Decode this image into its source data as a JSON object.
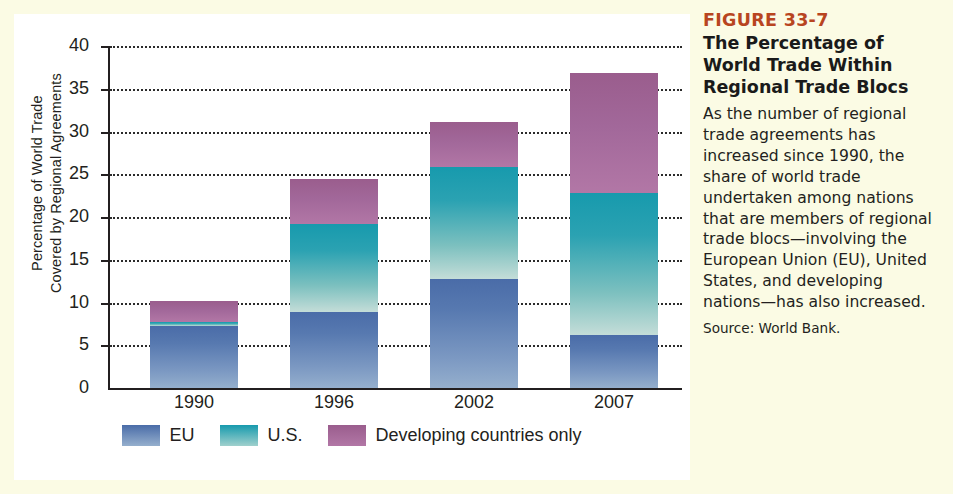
{
  "figure": {
    "number": "FIGURE 33-7",
    "title": "The Percentage of World Trade Within Regional Trade Blocs",
    "body": "As the number of regional trade agreements has increased since 1990, the share of world trade undertaken among nations that are members of regional trade blocs—involving the European Union (EU), United States, and developing nations—has also increased.",
    "source": "Source: World Bank.",
    "accent_color": "#b8451f"
  },
  "chart_data": {
    "type": "bar",
    "stacked": true,
    "title": "The Percentage of World Trade Within Regional Trade Blocs",
    "xlabel": "",
    "ylabel": "Percentage of World Trade\nCovered by Regional Agreements",
    "categories": [
      "1990",
      "1996",
      "2002",
      "2007"
    ],
    "ylim": [
      0,
      40
    ],
    "yticks": [
      0,
      5,
      10,
      15,
      20,
      25,
      30,
      35,
      40
    ],
    "ytick_labels": [
      "0",
      "5",
      "10",
      "15",
      "20",
      "25",
      "30",
      "35",
      "40"
    ],
    "grid": true,
    "grid_style": "dotted-horizontal",
    "legend_position": "bottom",
    "series": [
      {
        "name": "EU",
        "color": "#4a6ca8",
        "values": [
          7.3,
          8.9,
          12.7,
          6.2
        ]
      },
      {
        "name": "U.S.",
        "color": "#179aad",
        "values": [
          0.4,
          10.3,
          13.1,
          16.6
        ]
      },
      {
        "name": "Developing countries only",
        "color": "#9a5d8d",
        "values": [
          2.5,
          5.3,
          5.3,
          14.0
        ]
      }
    ],
    "totals": [
      10.2,
      24.5,
      31.1,
      36.8
    ],
    "segment_tops": [
      {
        "category": "1990",
        "eu_top": 7.3,
        "us_top": 7.7,
        "bar_top": 10.2
      },
      {
        "category": "1996",
        "eu_top": 8.9,
        "us_top": 19.2,
        "bar_top": 24.5
      },
      {
        "category": "2002",
        "eu_top": 12.7,
        "us_top": 25.8,
        "bar_top": 31.1
      },
      {
        "category": "2007",
        "eu_top": 6.2,
        "us_top": 22.8,
        "bar_top": 36.8
      }
    ]
  },
  "legend": [
    {
      "label": "EU",
      "color": "#4a6ca8"
    },
    {
      "label": "U.S.",
      "color": "#179aad"
    },
    {
      "label": "Developing countries only",
      "color": "#9a5d8d"
    }
  ]
}
